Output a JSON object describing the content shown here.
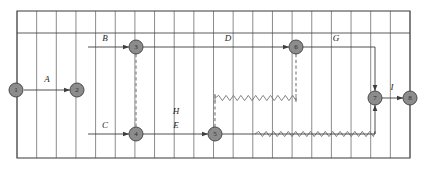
{
  "diagram": {
    "type": "time-scaled-network-diagram",
    "colors": {
      "frame": "#4a4a4a",
      "gridline": "#6f6f6f",
      "node_fill": "#8c8c8c",
      "node_stroke": "#4a4a4a",
      "arrow": "#3d3d3d",
      "dummy": "#8a8a8a",
      "float": "#6d6d6d",
      "label_text": "#1d1d1d",
      "node_text": "#2b2b2b",
      "background": "#ffffff"
    },
    "frame": {
      "left": 17,
      "top": 11,
      "right": 410,
      "bottom": 158,
      "grid_step": 19.65,
      "grid_columns": 20,
      "horizontal_rule_y": 33
    },
    "rows": {
      "upper_y": 47,
      "middle_y": 90,
      "node1_y": 90,
      "float_upper_y": 98,
      "lower_y": 134
    },
    "nodes": [
      {
        "id": "1",
        "label": "1",
        "x": 16,
        "y": 90
      },
      {
        "id": "2",
        "label": "2",
        "x": 77,
        "y": 90
      },
      {
        "id": "3",
        "label": "3",
        "x": 136,
        "y": 47
      },
      {
        "id": "4",
        "label": "4",
        "x": 136,
        "y": 134
      },
      {
        "id": "5",
        "label": "5",
        "x": 215,
        "y": 134
      },
      {
        "id": "6",
        "label": "6",
        "x": 296,
        "y": 47
      },
      {
        "id": "7",
        "label": "7",
        "x": 375,
        "y": 98
      },
      {
        "id": "8",
        "label": "8",
        "x": 410,
        "y": 98
      }
    ],
    "node_radius": 7,
    "activities": [
      {
        "id": "A",
        "label": "A",
        "from": "1",
        "to": "2",
        "label_x": 47,
        "label_y": 82,
        "path": "M 24 90 L 70 90",
        "arrow_at": [
          70,
          90
        ],
        "arrow_dir": "right"
      },
      {
        "id": "B",
        "label": "B",
        "from": "3",
        "to": "3",
        "label_x": 105,
        "label_y": 41,
        "path": "M 88 47 L 129 47",
        "arrow_at": [
          129,
          47
        ],
        "arrow_dir": "right"
      },
      {
        "id": "C",
        "label": "C",
        "from": "4",
        "to": "4",
        "label_x": 105,
        "label_y": 128,
        "path": "M 88 134 L 129 134",
        "arrow_at": [
          129,
          134
        ],
        "arrow_dir": "right"
      },
      {
        "id": "D",
        "label": "D",
        "from": "3",
        "to": "6",
        "label_x": 228,
        "label_y": 41,
        "path": "M 143 47 L 289 47",
        "arrow_at": [
          289,
          47
        ],
        "arrow_dir": "right"
      },
      {
        "id": "E",
        "label": "E",
        "from": "4",
        "to": "5",
        "label_x": 176,
        "label_y": 128,
        "path": "M 143 134 L 208 134",
        "arrow_at": [
          208,
          134
        ],
        "arrow_dir": "right"
      },
      {
        "id": "G",
        "label": "G",
        "from": "6",
        "to": "7",
        "label_x": 336,
        "label_y": 41,
        "path": "M 303 47 L 375 47 L 375 91",
        "arrow_at": [
          375,
          91
        ],
        "arrow_dir": "down"
      },
      {
        "id": "H",
        "label": "H",
        "from": "5",
        "to": "7",
        "label_x": 176,
        "label_y": 114,
        "path": "M 222 134 L 375 134 L 375 105",
        "arrow_at": [
          375,
          105
        ],
        "arrow_dir": "up"
      },
      {
        "id": "I",
        "label": "I",
        "from": "7",
        "to": "8",
        "label_x": 392,
        "label_y": 90,
        "path": "M 382 98 L 403 98",
        "arrow_at": [
          403,
          98
        ],
        "arrow_dir": "right"
      }
    ],
    "dummy_links": [
      {
        "id": "dummy-3-4",
        "from": "3",
        "to": "4",
        "x": 136,
        "y1": 54,
        "y2": 127
      },
      {
        "id": "dummy-5-up",
        "from": "5",
        "to": "float-top",
        "x": 215,
        "y1": 127,
        "y2": 94
      },
      {
        "id": "dummy-6-dn",
        "from": "6",
        "to": "float-top",
        "x": 296,
        "y1": 54,
        "y2": 94
      }
    ],
    "float_lines": [
      {
        "id": "float-upper",
        "x1": 215,
        "x2": 296,
        "y": 98,
        "stub_left": [
          94,
          102
        ],
        "stub_right": [
          94,
          102
        ]
      },
      {
        "id": "float-lower",
        "x1": 255,
        "x2": 375,
        "y": 134,
        "stub_left": null,
        "stub_right": null
      }
    ],
    "legend": {
      "solid_meaning": "activity duration",
      "dashed_meaning": "dummy activity",
      "wavy_meaning": "float"
    }
  }
}
